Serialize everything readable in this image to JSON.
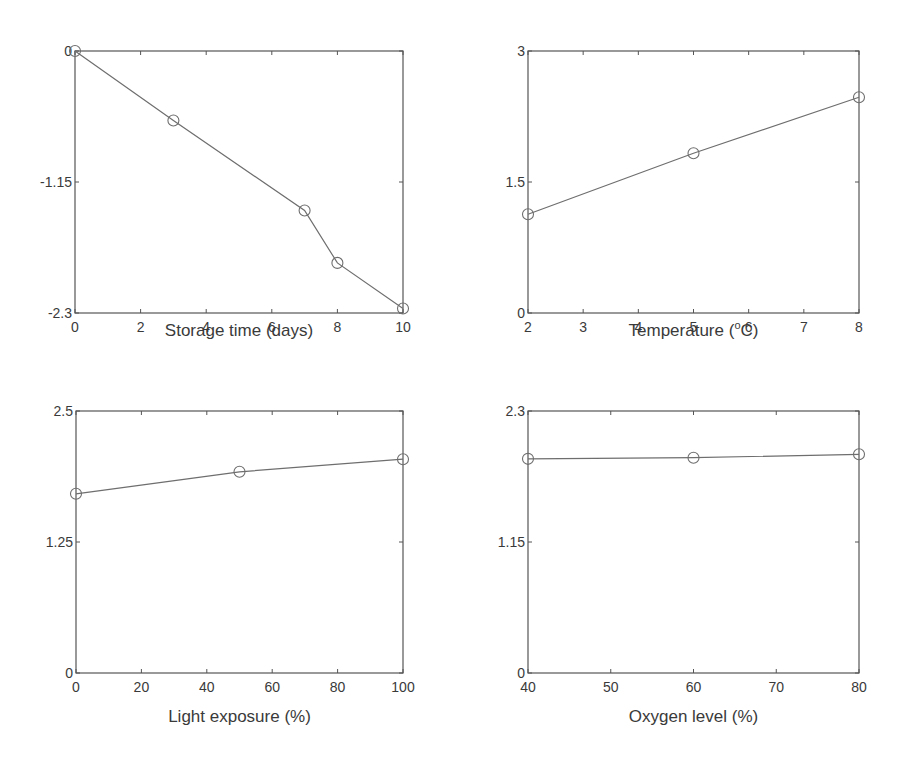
{
  "figure": {
    "width": 903,
    "height": 765,
    "line_color": "#6e6e6e",
    "axis_color": "#555555",
    "marker_color": "#6e6e6e",
    "background": "#ffffff"
  },
  "chart_data": [
    {
      "type": "line",
      "title": "",
      "xlabel": "Storage time (days)",
      "ylabel": "",
      "x": [
        0,
        3,
        7,
        8,
        10
      ],
      "series": [
        {
          "name": "",
          "values": [
            0,
            -0.61,
            -1.4,
            -1.86,
            -2.26
          ],
          "marker": "circle-open"
        }
      ],
      "xlim": [
        0,
        10
      ],
      "ylim": [
        -2.3,
        0
      ],
      "xticks": [
        0,
        2,
        4,
        6,
        8,
        10
      ],
      "xtick_labels": [
        "0",
        "2",
        "4",
        "6",
        "8",
        "10"
      ],
      "yticks": [
        -2.3,
        -1.15,
        0
      ],
      "ytick_labels": [
        "-2.3",
        "-1.15",
        "0"
      ],
      "grid": false,
      "legend": "none",
      "box": {
        "left": 75,
        "top": 51,
        "right": 403,
        "bottom": 313
      },
      "xlabel_y": 336
    },
    {
      "type": "line",
      "title": "",
      "xlabel": "Temperature (",
      "xlabel_sup": "o",
      "xlabel_tail": "C)",
      "ylabel": "",
      "x": [
        2,
        5,
        8
      ],
      "series": [
        {
          "name": "",
          "values": [
            1.13,
            1.83,
            2.47
          ],
          "marker": "circle-open"
        }
      ],
      "xlim": [
        2,
        8
      ],
      "ylim": [
        0,
        3
      ],
      "xticks": [
        2,
        3,
        4,
        5,
        6,
        7,
        8
      ],
      "xtick_labels": [
        "2",
        "3",
        "4",
        "5",
        "6",
        "7",
        "8"
      ],
      "yticks": [
        0,
        1.5,
        3
      ],
      "ytick_labels": [
        "0",
        "1.5",
        "3"
      ],
      "grid": false,
      "legend": "none",
      "box": {
        "left": 528,
        "top": 51,
        "right": 859,
        "bottom": 313
      },
      "xlabel_y": 336
    },
    {
      "type": "line",
      "title": "",
      "xlabel": "Light exposure (%)",
      "ylabel": "",
      "x": [
        0,
        50,
        100
      ],
      "series": [
        {
          "name": "",
          "values": [
            1.71,
            1.92,
            2.04
          ],
          "marker": "circle-open"
        }
      ],
      "xlim": [
        0,
        100
      ],
      "ylim": [
        0,
        2.5
      ],
      "xticks": [
        0,
        20,
        40,
        60,
        80,
        100
      ],
      "xtick_labels": [
        "0",
        "20",
        "40",
        "60",
        "80",
        "100"
      ],
      "yticks": [
        0,
        1.25,
        2.5
      ],
      "ytick_labels": [
        "0",
        "1.25",
        "2.5"
      ],
      "grid": false,
      "legend": "none",
      "box": {
        "left": 76,
        "top": 411,
        "right": 403,
        "bottom": 673
      },
      "xlabel_y": 722
    },
    {
      "type": "line",
      "title": "",
      "xlabel": "Oxygen level (%)",
      "ylabel": "",
      "x": [
        40,
        60,
        80
      ],
      "series": [
        {
          "name": "",
          "values": [
            1.88,
            1.89,
            1.92
          ],
          "marker": "circle-open"
        }
      ],
      "xlim": [
        40,
        80
      ],
      "ylim": [
        0,
        2.3
      ],
      "xticks": [
        40,
        50,
        60,
        70,
        80
      ],
      "xtick_labels": [
        "40",
        "50",
        "60",
        "70",
        "80"
      ],
      "yticks": [
        0,
        1.15,
        2.3
      ],
      "ytick_labels": [
        "0",
        "1.15",
        "2.3"
      ],
      "grid": false,
      "legend": "none",
      "box": {
        "left": 528,
        "top": 411,
        "right": 859,
        "bottom": 673
      },
      "xlabel_y": 722
    }
  ]
}
